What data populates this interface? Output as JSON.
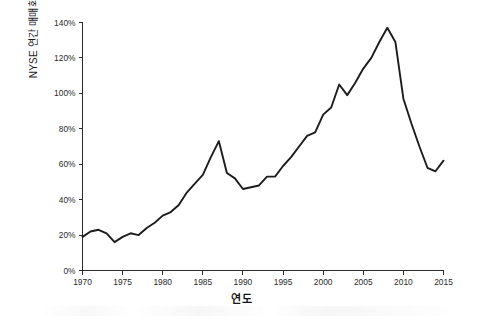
{
  "chart_data": {
    "type": "line",
    "title": "",
    "xlabel": "연도",
    "ylabel": "NYSE 연간 매매회전율",
    "xlim": [
      1970,
      2015
    ],
    "ylim": [
      0,
      140
    ],
    "grid": false,
    "legend": false,
    "y_tick_labels": [
      "0%",
      "20%",
      "40%",
      "60%",
      "80%",
      "100%",
      "120%",
      "140%"
    ],
    "y_tick_values": [
      0,
      20,
      40,
      60,
      80,
      100,
      120,
      140
    ],
    "x_tick_labels": [
      "1970",
      "1975",
      "1980",
      "1985",
      "1990",
      "1995",
      "2000",
      "2005",
      "2010",
      "2015"
    ],
    "x_tick_values": [
      1970,
      1975,
      1980,
      1985,
      1990,
      1995,
      2000,
      2005,
      2010,
      2015
    ],
    "y_unit": "%",
    "series": [
      {
        "name": "NYSE 연간 매매회전율",
        "color": "#1c1c1c",
        "x": [
          1970,
          1971,
          1972,
          1973,
          1974,
          1975,
          1976,
          1977,
          1978,
          1979,
          1980,
          1981,
          1982,
          1983,
          1984,
          1985,
          1986,
          1987,
          1988,
          1989,
          1990,
          1991,
          1992,
          1993,
          1994,
          1995,
          1996,
          1997,
          1998,
          1999,
          2000,
          2001,
          2002,
          2003,
          2004,
          2005,
          2006,
          2007,
          2008,
          2009,
          2010,
          2011,
          2012,
          2013,
          2014,
          2015
        ],
        "values": [
          19,
          22,
          23,
          21,
          16,
          19,
          21,
          20,
          24,
          27,
          31,
          33,
          37,
          44,
          49,
          54,
          64,
          73,
          55,
          52,
          46,
          47,
          48,
          53,
          53,
          59,
          64,
          70,
          76,
          78,
          88,
          92,
          105,
          99,
          106,
          114,
          120,
          129,
          137,
          129,
          97,
          83,
          70,
          58,
          56,
          62
        ]
      }
    ]
  },
  "figure": {
    "background_color": "#ffffff",
    "line_color": "#1c1c1c",
    "axis_color": "#2b2b2b"
  }
}
